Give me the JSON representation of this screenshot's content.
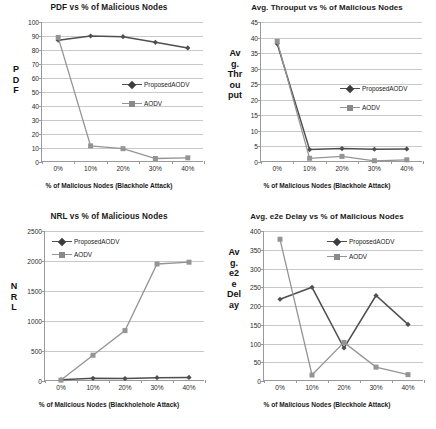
{
  "figure": {
    "panels": [
      "pdf",
      "throughput",
      "nrl",
      "delay"
    ]
  },
  "series_names": {
    "proposed": "ProposedAODV",
    "aodv": "AODV"
  },
  "colors": {
    "proposed": "#4f4f4f",
    "aodv": "#949494",
    "grid": "#c9c9c9",
    "axis": "#9a9a9a",
    "text": "#1a1a1a",
    "background": "#ffffff"
  },
  "chart_data": [
    {
      "id": "pdf",
      "type": "line",
      "title": "PDF vs % of Malicious Nodes",
      "xlabel": "% of Malicious Nodes (Blackhole Attack)",
      "ylabel": "PDF",
      "ylabel_lines": [
        "P",
        "D",
        "F"
      ],
      "categories": [
        "0%",
        "10%",
        "20%",
        "30%",
        "40%"
      ],
      "yticks": [
        0,
        10,
        20,
        30,
        40,
        50,
        60,
        70,
        80,
        90,
        100
      ],
      "ylim": [
        0,
        100
      ],
      "grid": true,
      "legend_position": "center-right",
      "series": [
        {
          "name": "ProposedAODV",
          "values": [
            87,
            90,
            89.5,
            85.5,
            81.5
          ]
        },
        {
          "name": "AODV",
          "values": [
            89,
            11.5,
            9.5,
            2.5,
            3
          ]
        }
      ]
    },
    {
      "id": "throughput",
      "type": "line",
      "title": "Avg. Throuput vs % of Malicious Nodes",
      "xlabel": "% of Malicious Nodes (Blackhole Attack)",
      "ylabel": "Avg. Throuput",
      "ylabel_lines": [
        "Av",
        "g.",
        "Thr",
        "ou",
        "put"
      ],
      "categories": [
        "0%",
        "10%",
        "20%",
        "30%",
        "40%"
      ],
      "yticks": [
        0,
        5,
        10,
        15,
        20,
        25,
        30,
        35,
        40,
        45
      ],
      "ylim": [
        0,
        45
      ],
      "grid": true,
      "legend_position": "center-right",
      "series": [
        {
          "name": "ProposedAODV",
          "values": [
            38,
            4,
            4.3,
            4.1,
            4.2
          ]
        },
        {
          "name": "AODV",
          "values": [
            38.8,
            1.2,
            1.8,
            0.4,
            0.7
          ]
        }
      ]
    },
    {
      "id": "nrl",
      "type": "line",
      "title": "NRL vs % of Malicious Nodes",
      "xlabel": "% of Malicious Nodes (Blackholehole Attack)",
      "ylabel": "NRL",
      "ylabel_lines": [
        "N",
        "R",
        "L"
      ],
      "categories": [
        "0%",
        "10%",
        "20%",
        "30%",
        "40%"
      ],
      "yticks": [
        0,
        500,
        1000,
        1500,
        2000,
        2500
      ],
      "ylim": [
        0,
        2500
      ],
      "grid": true,
      "legend_position": "top-left",
      "series": [
        {
          "name": "ProposedAODV",
          "values": [
            20,
            45,
            40,
            55,
            60
          ]
        },
        {
          "name": "AODV",
          "values": [
            15,
            430,
            840,
            1950,
            1980
          ]
        }
      ]
    },
    {
      "id": "delay",
      "type": "line",
      "title": "Avg. e2e Delay vs % of Malicious Nodes",
      "xlabel": "% of Malicious Nodes (Bleckhole Attack)",
      "ylabel": "Avg. e2e Delay",
      "ylabel_lines": [
        "Av",
        "g.",
        "e2",
        "e",
        "Del",
        "ay"
      ],
      "categories": [
        "0%",
        "10%",
        "20%",
        "30%",
        "40%"
      ],
      "yticks": [
        0,
        50,
        100,
        150,
        200,
        250,
        300,
        350,
        400
      ],
      "ylim": [
        0,
        400
      ],
      "grid": true,
      "legend_position": "top-right",
      "series": [
        {
          "name": "ProposedAODV",
          "values": [
            218,
            250,
            88,
            228,
            151
          ]
        },
        {
          "name": "AODV",
          "values": [
            378,
            16,
            103,
            37,
            17
          ]
        }
      ]
    }
  ]
}
